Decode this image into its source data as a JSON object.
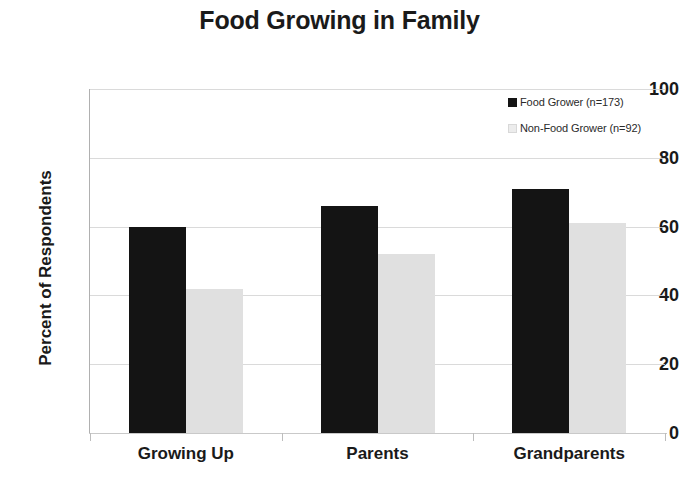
{
  "chart_data": {
    "type": "bar",
    "title": "Food Growing in Family",
    "xlabel": "",
    "ylabel": "Percent of Respondents",
    "categories": [
      "Growing Up",
      "Parents",
      "Grandparents"
    ],
    "series": [
      {
        "name": "Food Grower (n=173)",
        "values": [
          60,
          66,
          71
        ],
        "color": "#141414"
      },
      {
        "name": "Non-Food Grower (n=92)",
        "values": [
          42,
          52,
          61
        ],
        "color": "#e0e0e0"
      }
    ],
    "ylim": [
      0,
      100
    ],
    "yticks": [
      0,
      20,
      40,
      60,
      80,
      100
    ],
    "ytick_labels": [
      "0",
      "20",
      "40",
      "60",
      "80",
      "100"
    ],
    "grid": true,
    "legend_position": "top-right"
  }
}
